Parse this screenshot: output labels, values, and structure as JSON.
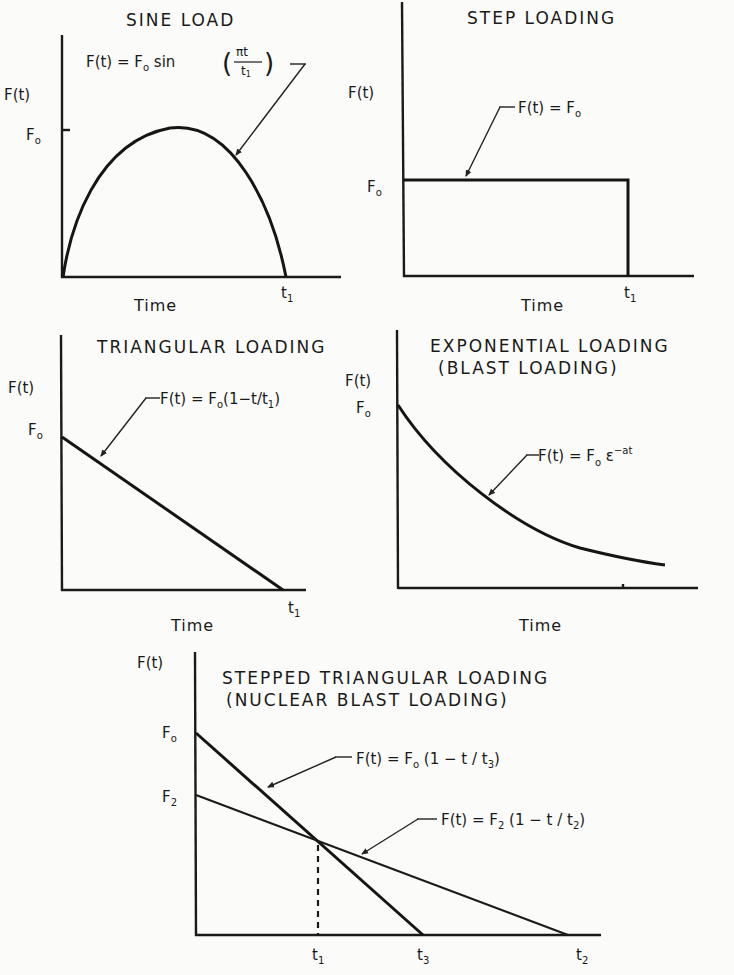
{
  "panels": {
    "sine": {
      "title": "SINE LOAD",
      "y_label": "F(t)",
      "f0_label": "F",
      "f0_sub": "o",
      "x_label": "Time",
      "t_label": "t",
      "t_sub": "1",
      "equation_prefix": "F(t) = F",
      "equation_sub": "o",
      "equation_func": " sin",
      "equation_frac_num": "πt",
      "equation_frac_den": "t",
      "equation_frac_den_sub": "1"
    },
    "step": {
      "title": "STEP LOADING",
      "y_label": "F(t)",
      "f0_label": "F",
      "f0_sub": "o",
      "x_label": "Time",
      "t_label": "t",
      "t_sub": "1",
      "equation_prefix": "F(t) = F",
      "equation_sub": "o"
    },
    "triangular": {
      "title": "TRIANGULAR  LOADING",
      "y_label": "F(t)",
      "f0_label": "F",
      "f0_sub": "o",
      "x_label": "Time",
      "t_label": "t",
      "t_sub": "1",
      "equation_prefix": "F(t) = F",
      "equation_sub": "o",
      "equation_suffix": "(1−t/t",
      "equation_suffix_sub": "1",
      "equation_close": ")"
    },
    "exponential": {
      "title": "EXPONENTIAL  LOADING",
      "subtitle": "(BLAST  LOADING)",
      "y_label": "F(t)",
      "f0_label": "F",
      "f0_sub": "o",
      "x_label": "Time",
      "equation_prefix": "F(t) = F",
      "equation_sub": "o",
      "equation_base": " ε",
      "equation_sup": "−at"
    },
    "stepped": {
      "title": "STEPPED  TRIANGULAR  LOADING",
      "subtitle": "(NUCLEAR  BLAST LOADING)",
      "y_label": "F(t)",
      "f0_label": "F",
      "f0_sub": "o",
      "f2_label": "F",
      "f2_sub": "2",
      "t1_label": "t",
      "t1_sub": "1",
      "t3_label": "t",
      "t3_sub": "3",
      "t2_label": "t",
      "t2_sub": "2",
      "eq1_prefix": "F(t) = F",
      "eq1_sub": "o",
      "eq1_suffix": "  (1 − t / t",
      "eq1_suffix_sub": "3",
      "eq1_close": ")",
      "eq2_prefix": "F(t) = F",
      "eq2_sub": "2",
      "eq2_suffix": " (1 − t / t",
      "eq2_suffix_sub": "2",
      "eq2_close": ")"
    }
  }
}
